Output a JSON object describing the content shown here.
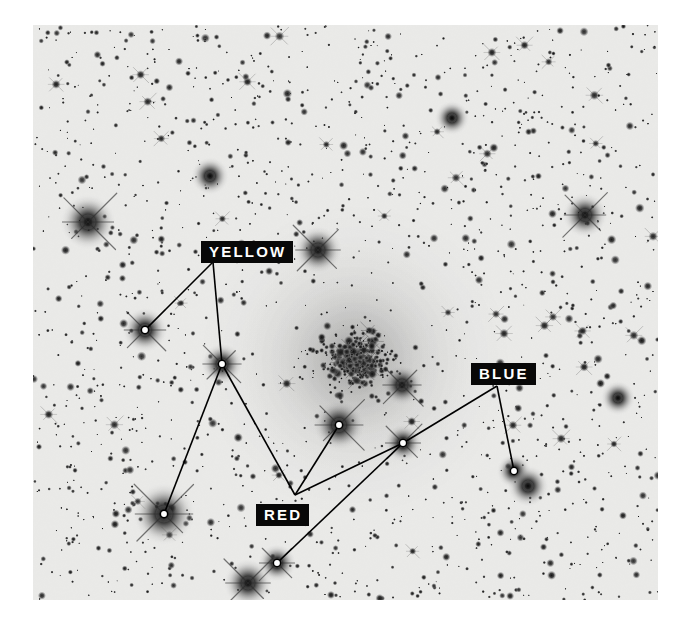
{
  "figure": {
    "kind": "astronomical-photographic-plate",
    "background_color": "#e9e9e7",
    "star_color": "#101010",
    "line_color": "#000000",
    "marker_fill": "#ffffff",
    "marker_stroke": "#000000",
    "plate": {
      "x": 33,
      "y": 25,
      "width": 625,
      "height": 575
    }
  },
  "labels": [
    {
      "id": "yellow",
      "text": "YELLOW",
      "x": 201,
      "y": 241,
      "box_color": "#080808",
      "text_color": "#ffffff"
    },
    {
      "id": "blue",
      "text": "BLUE",
      "x": 471,
      "y": 363,
      "box_color": "#080808",
      "text_color": "#ffffff"
    },
    {
      "id": "red",
      "text": "RED",
      "x": 256,
      "y": 504,
      "box_color": "#080808",
      "text_color": "#ffffff"
    }
  ],
  "markers": [
    {
      "id": "m1",
      "group": "yellow",
      "x": 145,
      "y": 330
    },
    {
      "id": "m2",
      "group": "yellow",
      "x": 222,
      "y": 364
    },
    {
      "id": "m3",
      "group": "yellow",
      "x": 164,
      "y": 514
    },
    {
      "id": "m4",
      "group": "red",
      "x": 339,
      "y": 425
    },
    {
      "id": "m5",
      "group": "red",
      "x": 403,
      "y": 443
    },
    {
      "id": "m6",
      "group": "red",
      "x": 277,
      "y": 563
    },
    {
      "id": "m7",
      "group": "blue",
      "x": 514,
      "y": 471
    }
  ],
  "leader_lines": [
    {
      "from": [
        213,
        262
      ],
      "to": [
        145,
        330
      ],
      "group": "yellow"
    },
    {
      "from": [
        213,
        262
      ],
      "to": [
        222,
        364
      ],
      "group": "yellow"
    },
    {
      "from": [
        222,
        364
      ],
      "to": [
        164,
        514
      ],
      "group": "yellow"
    },
    {
      "from": [
        222,
        364
      ],
      "to": [
        295,
        495
      ],
      "group": "red"
    },
    {
      "from": [
        295,
        495
      ],
      "to": [
        339,
        425
      ],
      "group": "red"
    },
    {
      "from": [
        295,
        495
      ],
      "to": [
        403,
        443
      ],
      "group": "red"
    },
    {
      "from": [
        277,
        563
      ],
      "to": [
        403,
        443
      ],
      "group": "red"
    },
    {
      "from": [
        403,
        443
      ],
      "to": [
        497,
        386
      ],
      "group": "blue"
    },
    {
      "from": [
        497,
        386
      ],
      "to": [
        514,
        471
      ],
      "group": "blue"
    }
  ],
  "star_field": {
    "seed": 20240917,
    "background_stars": 1750,
    "cluster": {
      "center_x": 355,
      "center_y": 360,
      "radius": 105,
      "star_count": 420,
      "halo_opacity": 0.3
    },
    "bright_stars": [
      {
        "x": 145,
        "y": 330,
        "r": 6.5,
        "spikes": true
      },
      {
        "x": 164,
        "y": 514,
        "r": 9.0,
        "spikes": true
      },
      {
        "x": 222,
        "y": 364,
        "r": 6.0,
        "spikes": true
      },
      {
        "x": 339,
        "y": 425,
        "r": 7.5,
        "spikes": true
      },
      {
        "x": 403,
        "y": 443,
        "r": 5.5,
        "spikes": true
      },
      {
        "x": 514,
        "y": 471,
        "r": 5.0,
        "spikes": false
      },
      {
        "x": 277,
        "y": 563,
        "r": 5.5,
        "spikes": true
      },
      {
        "x": 88,
        "y": 222,
        "r": 8.0,
        "spikes": true
      },
      {
        "x": 318,
        "y": 250,
        "r": 7.0,
        "spikes": true
      },
      {
        "x": 402,
        "y": 385,
        "r": 6.0,
        "spikes": true
      },
      {
        "x": 585,
        "y": 215,
        "r": 6.5,
        "spikes": true
      },
      {
        "x": 248,
        "y": 583,
        "r": 7.0,
        "spikes": true
      },
      {
        "x": 528,
        "y": 486,
        "r": 6.0,
        "spikes": false
      },
      {
        "x": 618,
        "y": 398,
        "r": 5.0,
        "spikes": false
      },
      {
        "x": 210,
        "y": 176,
        "r": 5.5,
        "spikes": false
      },
      {
        "x": 452,
        "y": 118,
        "r": 5.0,
        "spikes": false
      }
    ]
  }
}
